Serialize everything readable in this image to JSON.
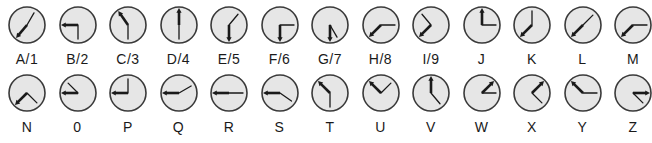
{
  "diagram": {
    "title": "",
    "face_color": "#e6e6e6",
    "rim_color": "#3a3a3a",
    "hand_color": "#1a1a1a",
    "rows": [
      [
        {
          "label": "A/1",
          "thick": 220,
          "thin": 30
        },
        {
          "label": "B/2",
          "thick": 270,
          "thin": 180
        },
        {
          "label": "C/3",
          "thick": 325,
          "thin": 180
        },
        {
          "label": "D/4",
          "thick": 0,
          "thin": 180
        },
        {
          "label": "E/5",
          "thick": 180,
          "thin": 40
        },
        {
          "label": "F/6",
          "thick": 180,
          "thin": 90
        },
        {
          "label": "G/7",
          "thick": 180,
          "thin": 150
        },
        {
          "label": "H/8",
          "thick": 225,
          "thin": 90
        },
        {
          "label": "I/9",
          "thick": 225,
          "thin": 320
        },
        {
          "label": "J",
          "thick": 0,
          "thin": 90
        },
        {
          "label": "K",
          "thick": 225,
          "thin": 0
        },
        {
          "label": "L",
          "thick": 225,
          "thin": 45
        },
        {
          "label": "M",
          "thick": 225,
          "thin": 90
        }
      ],
      [
        {
          "label": "N",
          "thick": 225,
          "thin": 135
        },
        {
          "label": "0",
          "thick": 270,
          "thin": 315
        },
        {
          "label": "P",
          "thick": 270,
          "thin": 0
        },
        {
          "label": "Q",
          "thick": 270,
          "thin": 60
        },
        {
          "label": "R",
          "thick": 270,
          "thin": 90
        },
        {
          "label": "S",
          "thick": 270,
          "thin": 125
        },
        {
          "label": "T",
          "thick": 315,
          "thin": 180
        },
        {
          "label": "U",
          "thick": 315,
          "thin": 45
        },
        {
          "label": "V",
          "thick": 0,
          "thin": 140
        },
        {
          "label": "W",
          "thick": 45,
          "thin": 90
        },
        {
          "label": "X",
          "thick": 45,
          "thin": 135
        },
        {
          "label": "Y",
          "thick": 315,
          "thin": 90
        },
        {
          "label": "Z",
          "thick": 90,
          "thin": 135
        }
      ]
    ]
  }
}
